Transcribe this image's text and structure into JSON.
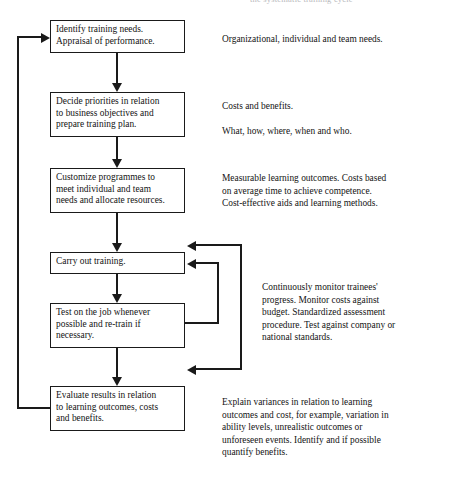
{
  "header": {
    "cut_off_text": "the systematic training cycle"
  },
  "diagram": {
    "type": "flowchart",
    "orientation": "vertical",
    "line_color": "#1a1a1a",
    "box_fill": "#ffffff",
    "nodes": [
      {
        "id": "identify",
        "lines": [
          "Identify training needs.",
          "Appraisal of performance."
        ]
      },
      {
        "id": "decide",
        "lines": [
          "Decide priorities in relation",
          "to business objectives and",
          "prepare training plan."
        ]
      },
      {
        "id": "customize",
        "lines": [
          "Customize programmes to",
          "meet individual and team",
          "needs and allocate resources."
        ]
      },
      {
        "id": "carry",
        "lines": [
          "Carry out training."
        ]
      },
      {
        "id": "test",
        "lines": [
          "Test on the job whenever",
          "possible and re-train if",
          "necessary."
        ]
      },
      {
        "id": "evaluate",
        "lines": [
          "Evaluate results in relation",
          "to learning outcomes, costs",
          "and benefits."
        ]
      }
    ],
    "annotations": [
      {
        "id": "needs",
        "paragraphs": [
          [
            "Organizational, individual and team needs."
          ]
        ]
      },
      {
        "id": "costs",
        "paragraphs": [
          [
            "Costs and benefits."
          ],
          [
            "What, how, where, when and who."
          ]
        ]
      },
      {
        "id": "measure",
        "paragraphs": [
          [
            "Measurable learning outcomes. Costs based",
            "on average time to achieve competence.",
            "Cost-effective aids and learning methods."
          ]
        ]
      },
      {
        "id": "monitor",
        "paragraphs": [
          [
            "Continuously monitor trainees'",
            "progress. Monitor costs against",
            "budget. Standardized assessment",
            "procedure. Test against company or",
            "national standards."
          ]
        ]
      },
      {
        "id": "explain",
        "paragraphs": [
          [
            "Explain variances in relation to learning",
            "outcomes and cost, for example, variation in",
            "ability levels, unrealistic outcomes or",
            "unforeseen events. Identify and if possible",
            "quantify benefits."
          ]
        ]
      }
    ],
    "connectors": [
      {
        "id": "identify-to-decide",
        "from": "identify",
        "to": "decide",
        "kind": "arrow-down"
      },
      {
        "id": "decide-to-customize",
        "from": "decide",
        "to": "customize",
        "kind": "arrow-down"
      },
      {
        "id": "customize-to-carry",
        "from": "customize",
        "to": "carry",
        "kind": "arrow-down"
      },
      {
        "id": "carry-to-test",
        "from": "carry",
        "to": "test",
        "kind": "arrow-down"
      },
      {
        "id": "test-to-evaluate",
        "from": "test",
        "to": "evaluate",
        "kind": "arrow-down"
      },
      {
        "id": "evaluate-to-identify",
        "from": "evaluate",
        "to": "identify",
        "kind": "feedback-loop-left"
      },
      {
        "id": "test-to-carry-inner",
        "from": "test",
        "to": "carry",
        "kind": "feedback-loop-right-inner"
      },
      {
        "id": "outer-loop-right",
        "from": "test",
        "to": "carry",
        "kind": "feedback-loop-right-outer"
      }
    ]
  }
}
